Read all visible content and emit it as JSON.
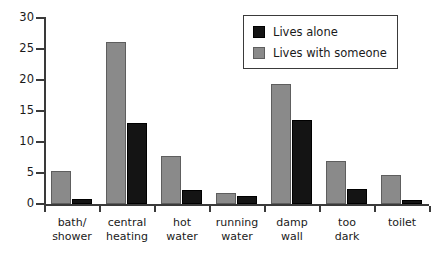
{
  "chart_data": {
    "type": "bar",
    "title": "",
    "xlabel": "",
    "ylabel": "",
    "ylim": [
      0,
      30
    ],
    "yticks": [
      0,
      5,
      10,
      15,
      20,
      25,
      30
    ],
    "grid": false,
    "legend_position": "top-right",
    "categories": [
      "bath/ shower",
      "central heating",
      "hot water",
      "running water",
      "damp wall",
      "too dark",
      "toilet"
    ],
    "category_lines": [
      [
        "bath/",
        "shower"
      ],
      [
        "central",
        "heating"
      ],
      [
        "hot",
        "water"
      ],
      [
        "running",
        "water"
      ],
      [
        "damp",
        "wall"
      ],
      [
        "too",
        "dark"
      ],
      [
        "toilet",
        ""
      ]
    ],
    "series": [
      {
        "name": "Lives alone",
        "color": "#141414",
        "values": [
          0.8,
          13.0,
          2.3,
          1.3,
          13.5,
          2.5,
          0.6
        ]
      },
      {
        "name": "Lives with someone",
        "color": "#8a8a8a",
        "values": [
          5.4,
          26.1,
          7.7,
          1.8,
          19.4,
          7.0,
          4.7
        ]
      }
    ]
  },
  "legend": {
    "items": [
      {
        "label": "Lives alone",
        "swatch": "black"
      },
      {
        "label": "Lives with someone",
        "swatch": "gray"
      }
    ]
  },
  "axis": {
    "y_tick_labels": [
      "0",
      "5",
      "10",
      "15",
      "20",
      "25",
      "30"
    ]
  },
  "colors": {
    "gray_bar": "#8a8a8a",
    "gray_bar_edge": "#5e5e5e",
    "black_bar": "#141414",
    "axis": "#3a3a3a",
    "text": "#1a1a1a",
    "background": "#ffffff"
  }
}
